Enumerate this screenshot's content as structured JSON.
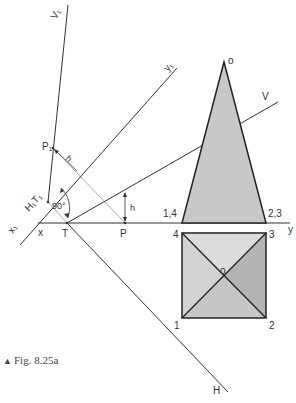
{
  "figure": {
    "caption": "Fig. 8.25a",
    "caption_marker": "▲"
  },
  "labels": {
    "V1": "V₁",
    "y1": "y₁",
    "x1": "x₁",
    "H1T1": "H₁T₁",
    "P1": "P₁",
    "h_upper": "h",
    "h_lower": "h",
    "angle": "90°",
    "x": "x",
    "T": "T",
    "P": "P",
    "y": "y",
    "V": "V",
    "H": "H",
    "apex_o": "o",
    "elev_left": "1,4",
    "elev_right": "2,3",
    "plan_4": "4",
    "plan_3": "3",
    "plan_1": "1",
    "plan_2": "2",
    "plan_o": "o"
  },
  "colors": {
    "line": "#333333",
    "construction": "#aaaaaa",
    "fill_light": "#d9d9d9",
    "fill_mid": "#c4c4c4",
    "fill_dark": "#b0b0b0"
  }
}
